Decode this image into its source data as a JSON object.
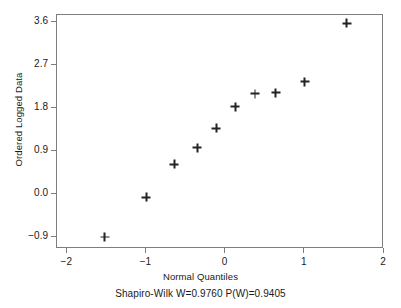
{
  "chart_data": {
    "type": "scatter",
    "title": "",
    "xlabel": "Normal Quantiles",
    "ylabel": "Ordered Logged Data",
    "caption": "Shapiro-Wilk W=0.9760 P(W)=0.9405",
    "xlim": [
      -2.13,
      2.0
    ],
    "ylim": [
      -1.15,
      3.75
    ],
    "xticks": [
      -2,
      -1,
      0,
      1,
      2
    ],
    "xticklabels": [
      "-2",
      "-1",
      "0",
      "1",
      "2"
    ],
    "yticks": [
      -0.9,
      0.0,
      0.9,
      1.8,
      2.7,
      3.6
    ],
    "yticklabels": [
      "-0.9",
      "0.0",
      "0.9",
      "1.8",
      "2.7",
      "3.6"
    ],
    "grid": false,
    "legend": null,
    "marker": "plus",
    "marker_color": "#232323",
    "frame_color": "#7d7d7d",
    "background": "#ffffff",
    "x": [
      -1.53,
      -1.0,
      -0.65,
      -0.36,
      -0.12,
      0.12,
      0.37,
      0.63,
      1.0,
      1.53
    ],
    "y": [
      -0.9,
      -0.07,
      0.62,
      0.97,
      1.38,
      1.83,
      2.1,
      2.12,
      2.35,
      3.58
    ],
    "points": [
      {
        "x": -1.53,
        "y": -0.9
      },
      {
        "x": -1.0,
        "y": -0.07
      },
      {
        "x": -0.65,
        "y": 0.62
      },
      {
        "x": -0.36,
        "y": 0.97
      },
      {
        "x": -0.12,
        "y": 1.38
      },
      {
        "x": 0.12,
        "y": 1.83
      },
      {
        "x": 0.37,
        "y": 2.1
      },
      {
        "x": 0.63,
        "y": 2.12
      },
      {
        "x": 1.0,
        "y": 2.35
      },
      {
        "x": 1.53,
        "y": 3.58
      }
    ]
  },
  "stats": {
    "test_name": "Shapiro-Wilk",
    "W": "0.9760",
    "PW": "0.9405"
  }
}
